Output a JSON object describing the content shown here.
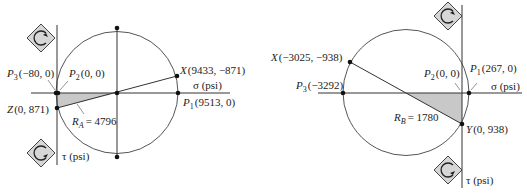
{
  "diagrams": [
    {
      "id": "A",
      "center_label": "",
      "radius_label": {
        "symbol": "R",
        "sub": "A",
        "value": "= 4796"
      },
      "points": {
        "P1": {
          "name": "P",
          "sub": "1",
          "coords": "(9513, 0)"
        },
        "P2": {
          "name": "P",
          "sub": "2",
          "coords": "(0, 0)"
        },
        "P3": {
          "name": "P",
          "sub": "3",
          "coords": "(−80, 0)"
        },
        "X": {
          "name": "X",
          "coords": "(9433, −871)"
        },
        "Z": {
          "name": "Z",
          "coords": "(0, 871)"
        }
      },
      "axes": {
        "sigma": "σ (psi)",
        "tau": "τ (psi)"
      },
      "icons": [
        "clockwise-rotation-icon",
        "counterclockwise-rotation-icon"
      ]
    },
    {
      "id": "B",
      "radius_label": {
        "symbol": "R",
        "sub": "B",
        "value": "= 1780"
      },
      "points": {
        "P1": {
          "name": "P",
          "sub": "1",
          "coords": "(267, 0)"
        },
        "P2": {
          "name": "P",
          "sub": "2",
          "coords": "(0, 0)"
        },
        "P3": {
          "name": "P",
          "sub": "3",
          "coords": "(−3292)"
        },
        "X": {
          "name": "X",
          "coords": "(−3025, −938)"
        },
        "Y": {
          "name": "Y",
          "coords": "(0, 938)"
        }
      },
      "axes": {
        "sigma": "σ (psi)",
        "tau": "τ (psi)"
      },
      "icons": [
        "clockwise-rotation-icon",
        "counterclockwise-rotation-icon"
      ]
    }
  ],
  "colors": {
    "line": "#333333",
    "shade": "#c8c8c8",
    "icon_fill": "#d6d6d6"
  }
}
